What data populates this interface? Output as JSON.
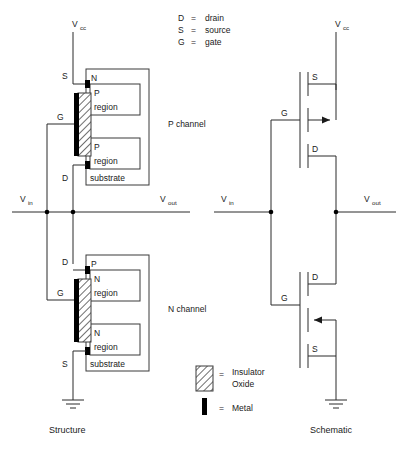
{
  "diagram": {
    "title_structure": "Structure",
    "title_schematic": "Schematic",
    "legend_terminals": [
      {
        "key": "D",
        "eq": "=",
        "value": "drain"
      },
      {
        "key": "S",
        "eq": "=",
        "value": "source"
      },
      {
        "key": "G",
        "eq": "=",
        "value": "gate"
      }
    ],
    "legend_materials": [
      {
        "swatch": "hatched-rect",
        "eq": "=",
        "line1": "Insulator",
        "line2": "Oxide"
      },
      {
        "swatch": "black-bar",
        "eq": "=",
        "line1": "Metal",
        "line2": ""
      }
    ],
    "channel_labels": {
      "p": "P  channel",
      "n": "N  channel"
    },
    "rails": {
      "vcc_base": "V",
      "vcc_sub": "cc",
      "vin_base": "V",
      "vin_sub": "in",
      "vout_base": "V",
      "vout_sub": "out"
    },
    "structure": {
      "pmos": {
        "terminal_top": "S",
        "terminal_gate": "G",
        "terminal_bottom": "D",
        "body_label": "N",
        "region_top_l1": "P",
        "region_top_l2": "region",
        "region_bot_l1": "P",
        "region_bot_l2": "region",
        "substrate": "substrate"
      },
      "nmos": {
        "terminal_top": "D",
        "terminal_gate": "G",
        "terminal_bottom": "S",
        "body_label": "P",
        "region_top_l1": "N",
        "region_top_l2": "region",
        "region_bot_l1": "N",
        "region_bot_l2": "region",
        "substrate": "substrate"
      }
    },
    "schematic": {
      "pmos": {
        "source": "S",
        "gate": "G",
        "drain": "D"
      },
      "nmos": {
        "drain": "D",
        "gate": "G",
        "source": "S"
      }
    },
    "colors": {
      "line": "#2a2a2a",
      "metal": "#000000",
      "background": "#ffffff",
      "hatch": "#555555"
    }
  }
}
